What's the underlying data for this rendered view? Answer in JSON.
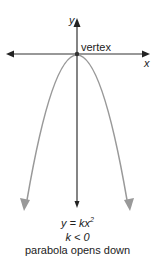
{
  "diagram": {
    "axes": {
      "x_label": "x",
      "y_label": "y"
    },
    "vertex_label": "vertex",
    "equation": {
      "lhs": "y = kx",
      "exponent": "2"
    },
    "condition": "k < 0",
    "description": "parabola opens down",
    "colors": {
      "axis": "#222222",
      "curve": "#999999",
      "text": "#222222"
    }
  }
}
